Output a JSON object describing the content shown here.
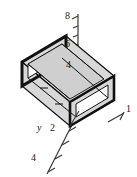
{
  "figure": {
    "type": "isometric-technical-drawing",
    "background_color": "#ffffff",
    "face_fill_color": "#d8d8d8",
    "edge_color": "#111111",
    "axis_color": "#3a3a3a"
  },
  "axes": {
    "vertical": {
      "name": "z-axis",
      "label": "",
      "ticks": [
        {
          "value": "4",
          "name": "z-tick-4"
        },
        {
          "value": "6",
          "name": "z-tick-6"
        },
        {
          "value": "8",
          "name": "z-tick-8"
        }
      ],
      "minor_tick_count": 5
    },
    "depth": {
      "name": "y-axis",
      "label": "y",
      "ticks": [
        {
          "value": "2",
          "name": "y-tick-2"
        },
        {
          "value": "4",
          "name": "y-tick-4"
        }
      ],
      "minor_tick_count": 3
    },
    "horizontal": {
      "name": "x-axis",
      "label": "",
      "ticks": [
        {
          "value": "1",
          "name": "x-tick-1"
        }
      ]
    }
  },
  "solid": {
    "name": "box-beam",
    "description": "open-ended rectangular tube drawn in isometric projection",
    "visible_faces": [
      "top",
      "front",
      "inner-top",
      "left-end-opening",
      "right-end-opening"
    ]
  }
}
